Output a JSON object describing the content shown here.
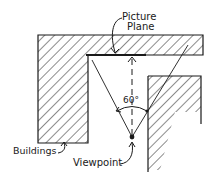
{
  "diagram": {
    "type": "plan-view sketch",
    "labels": {
      "picture_plane_line1": "Picture",
      "picture_plane_line2": "Plane",
      "angle": "60°",
      "buildings": "Buildings",
      "viewpoint": "Viewpoint"
    },
    "elements": [
      {
        "name": "top-building",
        "kind": "hatched-block"
      },
      {
        "name": "left-building",
        "kind": "hatched-block"
      },
      {
        "name": "right-building",
        "kind": "hatched-block"
      },
      {
        "name": "picture-plane",
        "kind": "thick-line"
      },
      {
        "name": "viewpoint",
        "kind": "dot"
      },
      {
        "name": "center-of-vision",
        "kind": "dashed-arrow"
      },
      {
        "name": "cone-of-vision",
        "kind": "angle",
        "value_degrees": 60
      }
    ],
    "colors": {
      "ink": "#1a1a1a",
      "background": "#ffffff"
    }
  }
}
